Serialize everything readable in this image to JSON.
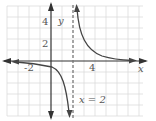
{
  "graph": {
    "function": "y = 1/(x - 2)",
    "asymptote_label": "x = 2",
    "x_axis_label": "x",
    "y_axis_label": "y",
    "tick_labels": {
      "x": [
        "-2",
        "4"
      ],
      "y": [
        "4",
        "2"
      ]
    },
    "x_range": [
      -4,
      8
    ],
    "y_range": [
      -5,
      5
    ],
    "vertical_asymptote": 2,
    "horizontal_asymptote": 0,
    "colors": {
      "grid": "#d9d9d9",
      "axis": "#333333",
      "curve": "#444444",
      "asymptote": "#777777"
    }
  }
}
